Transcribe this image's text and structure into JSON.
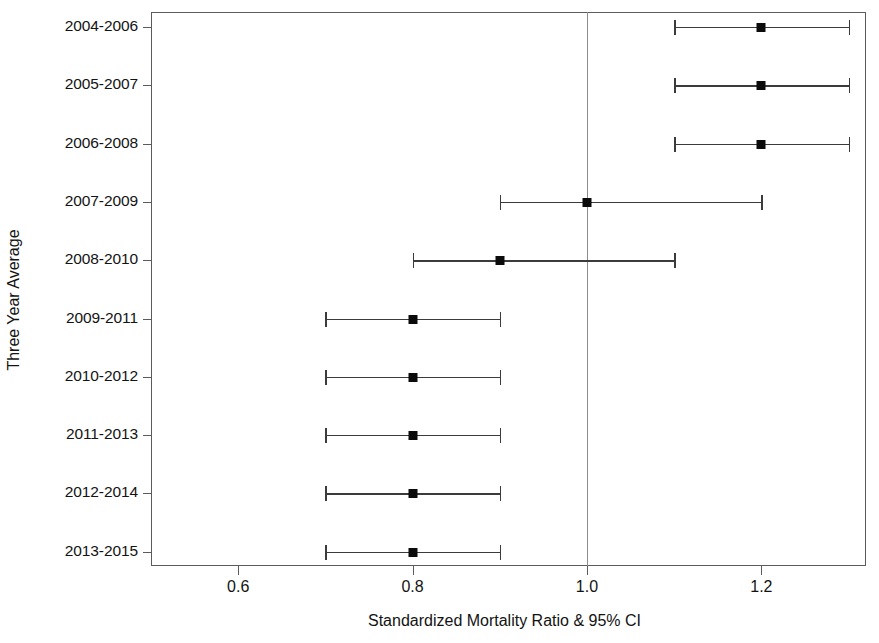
{
  "chart_data": {
    "type": "scatter",
    "title": "",
    "xlabel": "Standardized Mortality Ratio & 95% CI",
    "ylabel": "Three Year Average",
    "xlim": [
      0.5,
      1.32
    ],
    "xticks": [
      0.6,
      0.8,
      1.0,
      1.2
    ],
    "xtick_labels": [
      "0.6",
      "0.8",
      "1.0",
      "1.2"
    ],
    "grid": false,
    "legend": null,
    "reference_line": 1.0,
    "categories": [
      "2004-2006",
      "2005-2007",
      "2006-2008",
      "2007-2009",
      "2008-2010",
      "2009-2011",
      "2010-2012",
      "2011-2013",
      "2012-2014",
      "2013-2015"
    ],
    "values": [
      1.2,
      1.2,
      1.2,
      1.0,
      0.9,
      0.8,
      0.8,
      0.8,
      0.8,
      0.8
    ],
    "ci_lower": [
      1.1,
      1.1,
      1.1,
      0.9,
      0.8,
      0.7,
      0.7,
      0.7,
      0.7,
      0.7
    ],
    "ci_upper": [
      1.3,
      1.3,
      1.3,
      1.2,
      1.1,
      0.9,
      0.9,
      0.9,
      0.9,
      0.9
    ],
    "series": [
      {
        "name": "Standardized Mortality Ratio",
        "points": [
          {
            "category": "2004-2006",
            "value": 1.2,
            "ci_lower": 1.1,
            "ci_upper": 1.3
          },
          {
            "category": "2005-2007",
            "value": 1.2,
            "ci_lower": 1.1,
            "ci_upper": 1.3
          },
          {
            "category": "2006-2008",
            "value": 1.2,
            "ci_lower": 1.1,
            "ci_upper": 1.3
          },
          {
            "category": "2007-2009",
            "value": 1.0,
            "ci_lower": 0.9,
            "ci_upper": 1.2
          },
          {
            "category": "2008-2010",
            "value": 0.9,
            "ci_lower": 0.8,
            "ci_upper": 1.1
          },
          {
            "category": "2009-2011",
            "value": 0.8,
            "ci_lower": 0.7,
            "ci_upper": 0.9
          },
          {
            "category": "2010-2012",
            "value": 0.8,
            "ci_lower": 0.7,
            "ci_upper": 0.9
          },
          {
            "category": "2011-2013",
            "value": 0.8,
            "ci_lower": 0.7,
            "ci_upper": 0.9
          },
          {
            "category": "2012-2014",
            "value": 0.8,
            "ci_lower": 0.7,
            "ci_upper": 0.9
          },
          {
            "category": "2013-2015",
            "value": 0.8,
            "ci_lower": 0.7,
            "ci_upper": 0.9
          }
        ]
      }
    ],
    "colors": {
      "marker": "#0b0b0b",
      "line": "#3b3b3b",
      "axis": "#5b5b5b",
      "reference": "#8d8d8d",
      "text": "#131313",
      "background": "#ffffff"
    }
  }
}
